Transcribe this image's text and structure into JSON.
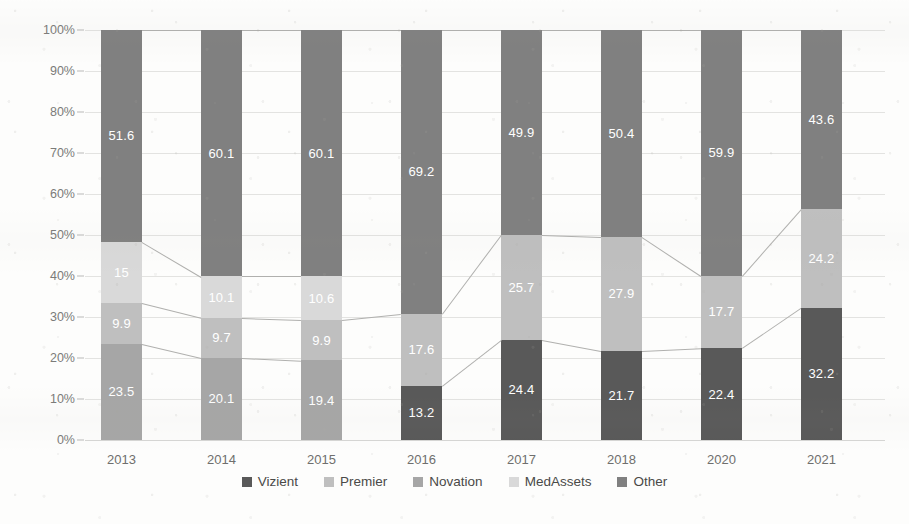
{
  "chart_data": {
    "type": "bar",
    "stacked": true,
    "normalized_percent": true,
    "title": "",
    "subtitle": "",
    "xlabel": "",
    "ylabel": "",
    "ylim": [
      0,
      100
    ],
    "grid": true,
    "legend_position": "bottom",
    "categories": [
      "2013",
      "2014",
      "2015",
      "2016",
      "2017",
      "2018",
      "2020",
      "2021"
    ],
    "ytick_labels": [
      "0%",
      "10%",
      "20%",
      "30%",
      "40%",
      "50%",
      "60%",
      "70%",
      "80%",
      "90%",
      "100%"
    ],
    "ytick_values": [
      0,
      10,
      20,
      30,
      40,
      50,
      60,
      70,
      80,
      90,
      100
    ],
    "series": [
      {
        "name": "Vizient",
        "color": "#595959",
        "values": [
          null,
          null,
          null,
          13.2,
          24.4,
          21.7,
          22.4,
          32.2
        ],
        "labels": [
          "",
          "",
          "",
          "13.2",
          "24.4",
          "21.7",
          "22.4",
          "32.2"
        ]
      },
      {
        "name": "Premier",
        "color": "#bfbfbf",
        "values": [
          9.9,
          9.7,
          9.9,
          17.6,
          25.7,
          27.9,
          17.7,
          24.2
        ],
        "labels": [
          "9.9",
          "9.7",
          "9.9",
          "17.6",
          "25.7",
          "27.9",
          "17.7",
          "24.2"
        ]
      },
      {
        "name": "Novation",
        "color": "#a6a6a6",
        "values": [
          23.5,
          20.1,
          19.4,
          null,
          null,
          null,
          null,
          null
        ],
        "labels": [
          "23.5",
          "20.1",
          "19.4",
          "",
          "",
          "",
          "",
          ""
        ]
      },
      {
        "name": "MedAssets",
        "color": "#d9d9d9",
        "values": [
          15,
          10.1,
          10.6,
          null,
          null,
          null,
          null,
          null
        ],
        "labels": [
          "15",
          "10.1",
          "10.6",
          "",
          "",
          "",
          "",
          ""
        ]
      },
      {
        "name": "Other",
        "color": "#808080",
        "values": [
          51.6,
          60.1,
          60.1,
          69.2,
          49.9,
          50.4,
          59.9,
          43.6
        ],
        "labels": [
          "51.6",
          "60.1",
          "60.1",
          "69.2",
          "49.9",
          "50.4",
          "59.9",
          "43.6"
        ]
      }
    ],
    "stack_order_bottom_to_top": [
      "Novation",
      "Vizient",
      "Premier",
      "MedAssets",
      "Other"
    ],
    "connector_lines": true
  },
  "legend": {
    "items": [
      {
        "label": "Vizient",
        "color": "#595959"
      },
      {
        "label": "Premier",
        "color": "#bfbfbf"
      },
      {
        "label": "Novation",
        "color": "#a6a6a6"
      },
      {
        "label": "MedAssets",
        "color": "#d9d9d9"
      },
      {
        "label": "Other",
        "color": "#808080"
      }
    ]
  }
}
